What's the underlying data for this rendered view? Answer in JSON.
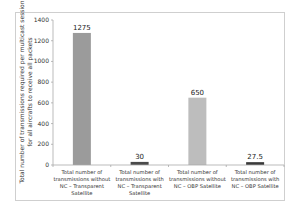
{
  "chart_data": {
    "type": "bar",
    "title": "",
    "xlabel": "",
    "ylabel_lines": [
      "Total number of transmissions required per multicast session",
      "for all aircrafts to receive all packets"
    ],
    "ylim": [
      0,
      1400
    ],
    "yticks": [
      0,
      200,
      400,
      600,
      800,
      1000,
      1200,
      1400
    ],
    "grid": false,
    "legend": "none",
    "categories": [
      [
        "Total number of",
        "transmissions without",
        "NC – Transparent",
        "Satellite"
      ],
      [
        "Total number of",
        "transmissions with",
        "NC – Transparent",
        "Satellite"
      ],
      [
        "Total number of",
        "transmissions without",
        "NC – OBP Satellite"
      ],
      [
        "Total number of",
        "transmissions with",
        "NC – OBP Satellite"
      ]
    ],
    "values": [
      1275,
      30,
      650,
      27.5
    ],
    "data_labels": [
      "1275",
      "30",
      "650",
      "27.5"
    ],
    "colors": [
      "#9b9b9b",
      "#4a4a4a",
      "#bdbdbd",
      "#3a3a3a"
    ]
  }
}
